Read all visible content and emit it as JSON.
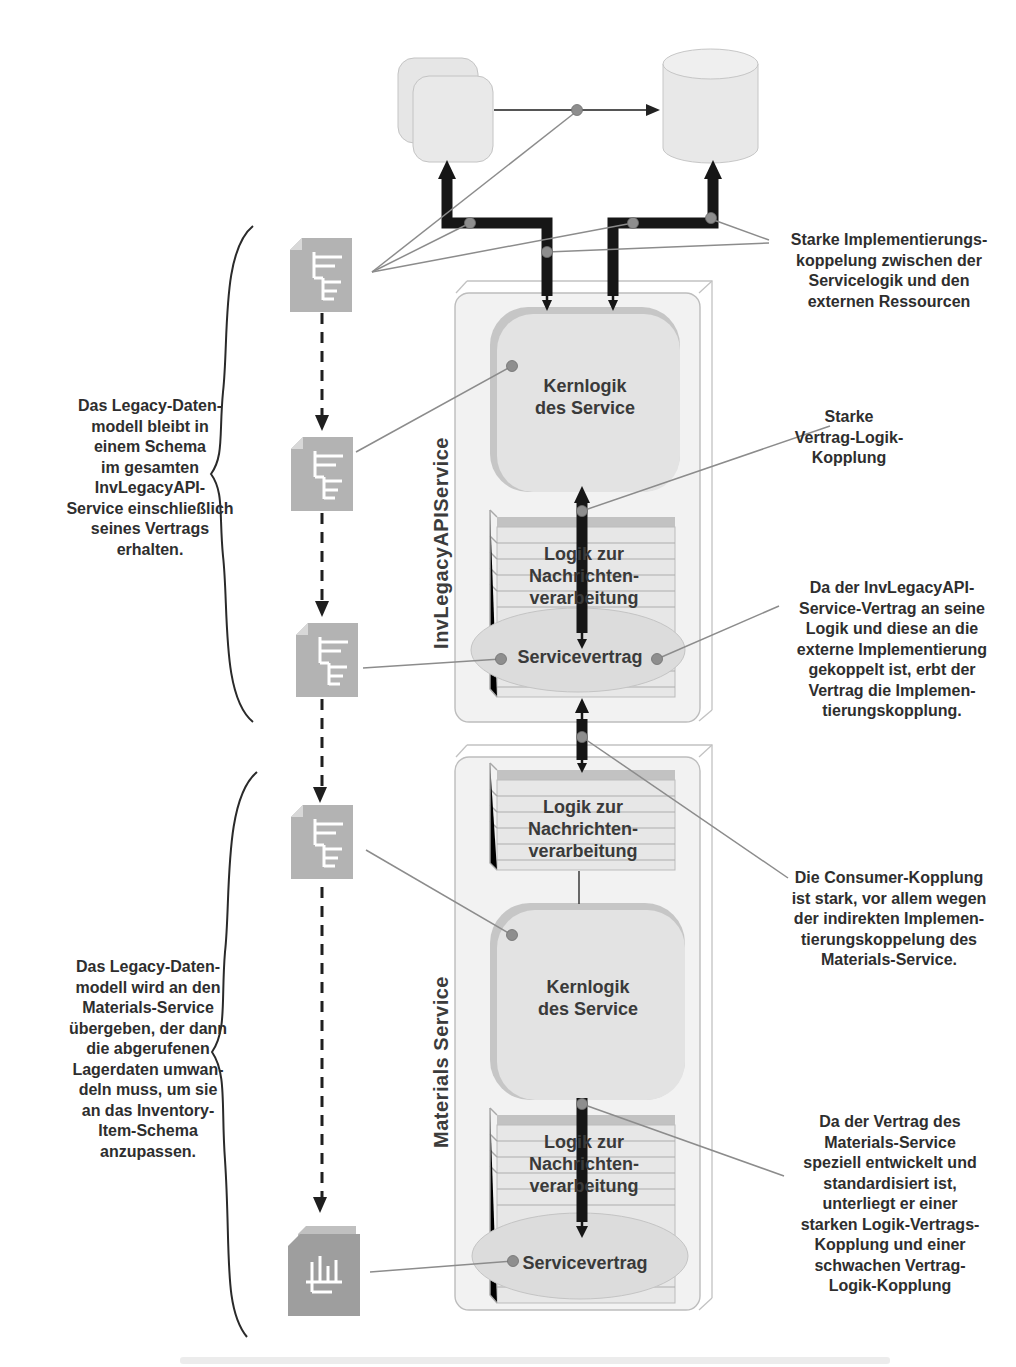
{
  "notes": {
    "left": [
      "Das Legacy-Daten-\nmodell bleibt in\neinem Schema\nim gesamten\nInvLegacyAPI-\nService einschließlich\nseines Vertrags\nerhalten.",
      "Das Legacy-Daten-\nmodell wird an den\nMaterials-Service\nübergeben, der dann\ndie abgerufenen\nLagerdaten umwan-\ndeln muss, um sie\nan das Inventory-\nItem-Schema\nanzupassen."
    ],
    "right": [
      "Starke Implementierungs-\nkoppelung zwischen der\nServicelogik und den\nexternen Ressourcen",
      "Starke\nVertrag-Logik-\nKopplung",
      "Da der InvLegacyAPI-\nService-Vertrag an seine\nLogik und diese an die\nexterne Implementierung\ngekoppelt ist, erbt der\nVertrag die Implemen-\ntierungskopplung.",
      "Die Consumer-Kopplung\nist stark, vor allem wegen\nder indirekten Implemen-\ntierungskoppelung des\nMaterials-Service.",
      "Da der Vertrag des\nMaterials-Service\nspeziell entwickelt und\nstandardisiert ist,\nunterliegt er einer\nstarken Logik-Vertrags-\nKopplung und einer\nschwachen Vertrag-\nLogik-Kopplung"
    ]
  },
  "services": {
    "invlegacy": {
      "name": "InvLegacyAPIService",
      "core": "Kernlogik\ndes Service",
      "messaging": "Logik zur\nNachrichten-\nverarbeitung",
      "contract": "Servicevertrag"
    },
    "materials": {
      "name": "Materials Service",
      "messaging_top": "Logik zur\nNachrichten-\nverarbeitung",
      "core": "Kernlogik\ndes Service",
      "messaging_bottom": "Logik zur\nNachrichten-\nverarbeitung",
      "contract": "Servicevertrag"
    }
  },
  "colors": {
    "thick_coupling": "#161616",
    "thin_line": "#8c8c8c",
    "dot": "#8e8e8e",
    "shape_fill": "#e7e7e7",
    "doc_fill": "#b3b3b3",
    "doc_dark": "#9e9e9e"
  }
}
